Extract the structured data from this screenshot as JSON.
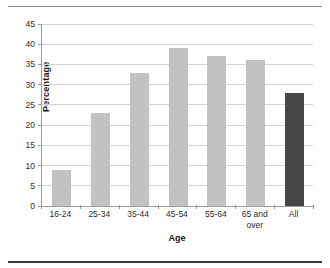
{
  "chart_data": {
    "type": "bar",
    "title": "",
    "subtitle": "",
    "xlabel": "Age",
    "ylabel": "Percentage",
    "categories": [
      "16-24",
      "25-34",
      "35-44",
      "45-54",
      "55-64",
      "65 and over",
      "All"
    ],
    "values": [
      9,
      23,
      33,
      39,
      37,
      36,
      28
    ],
    "ylim": [
      0,
      45
    ],
    "ytick_labels": [
      "0",
      "5",
      "10",
      "15",
      "20",
      "25",
      "30",
      "35",
      "40",
      "45"
    ],
    "ytick_values": [
      0,
      5,
      10,
      15,
      20,
      25,
      30,
      35,
      40,
      45
    ],
    "grid": "horizontal",
    "legend": "none",
    "bar_colors": [
      "#c2c2c2",
      "#c2c2c2",
      "#c2c2c2",
      "#c2c2c2",
      "#c2c2c2",
      "#c2c2c2",
      "#474747"
    ],
    "gridline_color": "#d4d4d4",
    "axis_color": "#9a9a9a",
    "series": [
      {
        "name": "Percentage",
        "values": [
          9,
          23,
          33,
          39,
          37,
          36,
          28
        ]
      }
    ]
  },
  "figure": {
    "top_rule_color": "#8c8c8c",
    "bottom_rule_color": "#3a3a3a",
    "background": "#ffffff"
  }
}
